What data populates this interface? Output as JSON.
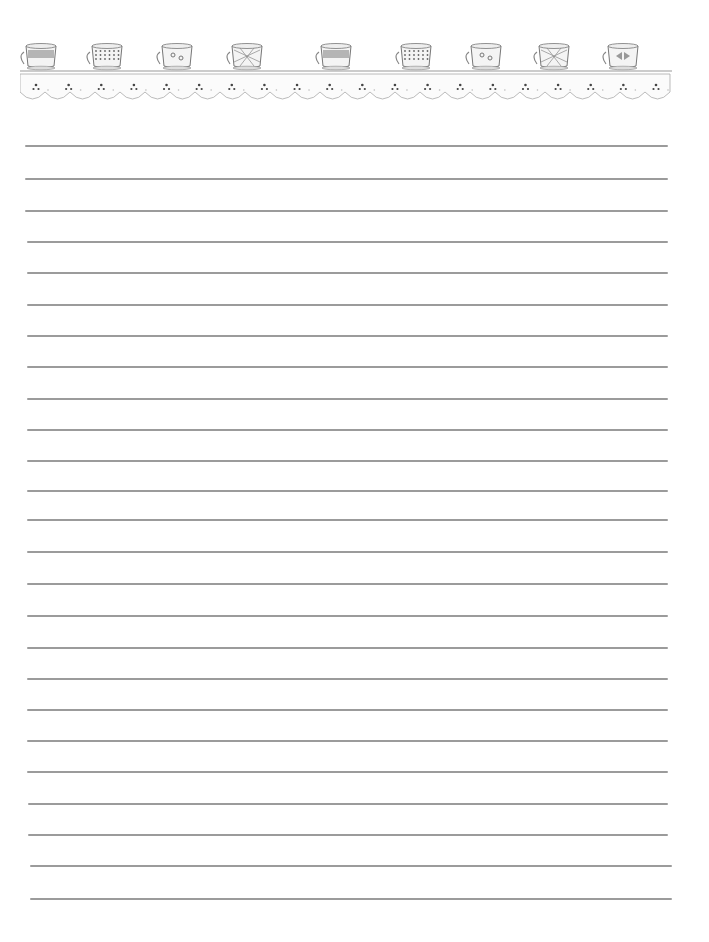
{
  "page": {
    "type": "lined-stationery",
    "background": "#ffffff",
    "line_color": "#8a8a8a"
  },
  "header_border": {
    "motif": "teacups-on-eyelet-lace",
    "cups": [
      {
        "style": "banded-cup",
        "x": 22
      },
      {
        "style": "dotted-cup",
        "x": 88
      },
      {
        "style": "floral-scalloped-cup",
        "x": 158
      },
      {
        "style": "quilted-mug",
        "x": 228
      },
      {
        "style": "banded-cup",
        "x": 317
      },
      {
        "style": "dotted-cup",
        "x": 397
      },
      {
        "style": "floral-scalloped-cup",
        "x": 467
      },
      {
        "style": "quilted-mug",
        "x": 535
      },
      {
        "style": "bow-cup",
        "x": 604
      }
    ],
    "lace_dots": 20
  },
  "lines": [
    {
      "y": 145,
      "x1": 25,
      "x2": 668
    },
    {
      "y": 178,
      "x1": 25,
      "x2": 668
    },
    {
      "y": 210,
      "x1": 25,
      "x2": 668
    },
    {
      "y": 241,
      "x1": 27,
      "x2": 668
    },
    {
      "y": 272,
      "x1": 27,
      "x2": 668
    },
    {
      "y": 304,
      "x1": 27,
      "x2": 668
    },
    {
      "y": 335,
      "x1": 27,
      "x2": 668
    },
    {
      "y": 366,
      "x1": 27,
      "x2": 668
    },
    {
      "y": 398,
      "x1": 27,
      "x2": 668
    },
    {
      "y": 429,
      "x1": 27,
      "x2": 668
    },
    {
      "y": 460,
      "x1": 27,
      "x2": 668
    },
    {
      "y": 490,
      "x1": 27,
      "x2": 668
    },
    {
      "y": 519,
      "x1": 27,
      "x2": 668
    },
    {
      "y": 551,
      "x1": 27,
      "x2": 668
    },
    {
      "y": 583,
      "x1": 27,
      "x2": 668
    },
    {
      "y": 615,
      "x1": 27,
      "x2": 668
    },
    {
      "y": 647,
      "x1": 27,
      "x2": 668
    },
    {
      "y": 678,
      "x1": 27,
      "x2": 668
    },
    {
      "y": 709,
      "x1": 27,
      "x2": 668
    },
    {
      "y": 740,
      "x1": 27,
      "x2": 668
    },
    {
      "y": 771,
      "x1": 27,
      "x2": 668
    },
    {
      "y": 803,
      "x1": 28,
      "x2": 668
    },
    {
      "y": 834,
      "x1": 28,
      "x2": 668
    },
    {
      "y": 865,
      "x1": 30,
      "x2": 672
    },
    {
      "y": 898,
      "x1": 30,
      "x2": 672
    }
  ]
}
